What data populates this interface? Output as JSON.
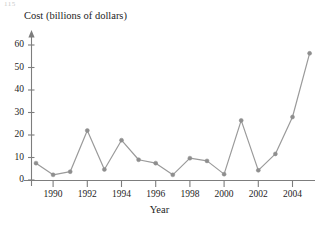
{
  "figure": {
    "corner_stub": "115",
    "title": "",
    "axis_color": "#7d7d7d",
    "series_color": "#9a9a9a",
    "marker_color": "#8e8e8e",
    "text_color": "#1d1d1d"
  },
  "chart_data": {
    "type": "line",
    "title": "",
    "subtitle": "",
    "xlabel": "Year",
    "ylabel": "Cost (billions of dollars)",
    "x": [
      1989,
      1990,
      1991,
      1992,
      1993,
      1994,
      1995,
      1996,
      1997,
      1998,
      1999,
      2000,
      2001,
      2002,
      2003,
      2004,
      2005
    ],
    "values": [
      7.5,
      2.3,
      3.7,
      22.0,
      4.7,
      17.7,
      9.0,
      7.5,
      2.3,
      9.7,
      8.5,
      2.6,
      26.5,
      4.3,
      11.6,
      28.0,
      56.3
    ],
    "xlim": [
      1988.6,
      2005.6
    ],
    "ylim": [
      0,
      65
    ],
    "xticks": [
      1990,
      1992,
      1994,
      1996,
      1998,
      2000,
      2002,
      2004
    ],
    "xtick_labels": [
      "1990",
      "1992",
      "1994",
      "1996",
      "1998",
      "2000",
      "2002",
      "2004"
    ],
    "yticks": [
      0,
      10,
      20,
      30,
      40,
      50,
      60
    ],
    "ytick_labels": [
      "0",
      "10",
      "20",
      "30",
      "40",
      "50",
      "60"
    ],
    "grid": false,
    "legend": null,
    "markers": "circle",
    "series": [
      {
        "name": "Cost",
        "values": [
          7.5,
          2.3,
          3.7,
          22.0,
          4.7,
          17.7,
          9.0,
          7.5,
          2.3,
          9.7,
          8.5,
          2.6,
          26.5,
          4.3,
          11.6,
          28.0,
          56.3
        ]
      }
    ]
  }
}
